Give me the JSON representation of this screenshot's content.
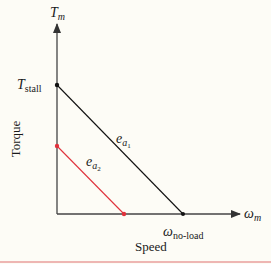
{
  "diagram": {
    "type": "torque-speed-curve",
    "y_axis": {
      "symbol": "T",
      "symbol_sub": "m",
      "label": "Torque"
    },
    "x_axis": {
      "symbol": "ω",
      "symbol_sub": "m",
      "label": "Speed"
    },
    "points": {
      "stall": {
        "symbol": "T",
        "symbol_sub": "stall"
      },
      "no_load": {
        "symbol": "ω",
        "symbol_sub": "no-load"
      }
    },
    "lines": [
      {
        "name": "e_a1",
        "symbol": "e",
        "sub": "a",
        "subsub": "1",
        "color": "#111111"
      },
      {
        "name": "e_a2",
        "symbol": "e",
        "sub": "a",
        "subsub": "2",
        "color": "#e0323c"
      }
    ],
    "colors": {
      "background": "#fdfcf6",
      "axes": "#333333",
      "line1": "#111111",
      "line2": "#e0323c",
      "rule": "#e07070"
    }
  }
}
